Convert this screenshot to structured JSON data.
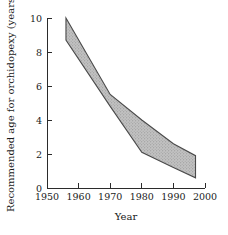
{
  "chart_data": {
    "type": "area",
    "title": "",
    "xlabel": "Year",
    "ylabel": "Recommended age for orchidopexy (years)",
    "xlim": [
      1950,
      2000
    ],
    "ylim": [
      0,
      10
    ],
    "grid": false,
    "legend": "none",
    "x_ticks": [
      1950,
      1960,
      1970,
      1980,
      1990,
      2000
    ],
    "x_tick_labels": [
      "1950",
      "1960",
      "1970",
      "1980",
      "1990",
      "2000"
    ],
    "y_ticks": [
      0,
      2,
      4,
      6,
      8,
      10
    ],
    "y_tick_labels": [
      "0",
      "2",
      "4",
      "6",
      "8",
      "10"
    ],
    "x": [
      1956,
      1970,
      1980,
      1990,
      1997
    ],
    "series": [
      {
        "name": "Upper recommended age",
        "values": [
          10.0,
          5.5,
          4.0,
          2.6,
          1.9
        ]
      },
      {
        "name": "Lower recommended age",
        "values": [
          8.7,
          4.8,
          2.1,
          1.2,
          0.6
        ]
      }
    ],
    "band": {
      "fill_color": "#bdbdbd",
      "edge_color": "#4a4a4a",
      "pattern": "stipple-dots",
      "description": "Shaded band between upper and lower recommended age for orchidopexy, declining from about 8.7-10 years in 1956 to about 0.6-1.9 years in 1997"
    }
  },
  "axes": {
    "x_axis_name": "year-axis",
    "y_axis_name": "age-axis"
  }
}
